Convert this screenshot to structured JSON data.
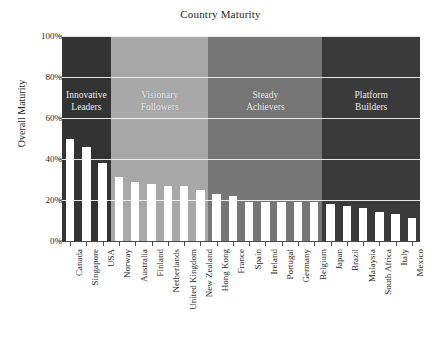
{
  "chart_data": {
    "type": "bar",
    "title": "Country Maturity",
    "xlabel": "",
    "ylabel": "Overall Maturity",
    "ylim": [
      0,
      100
    ],
    "yunit": "%",
    "grid": true,
    "legend": "none",
    "ytick_labels": [
      "0%",
      "20%",
      "40%",
      "60%",
      "80%",
      "100%"
    ],
    "ytick_values": [
      0,
      20,
      40,
      60,
      80,
      100
    ],
    "categories": [
      "Canada",
      "Singapore",
      "USA",
      "Norway",
      "Australia",
      "Finland",
      "Netherlands",
      "United Kingdom",
      "New Zealand",
      "Hong Kong",
      "France",
      "Spain",
      "Ireland",
      "Portugal",
      "Germany",
      "Belgium",
      "Japan",
      "Brazil",
      "Malaysia",
      "South Africa",
      "Italy",
      "Mexico"
    ],
    "values": [
      50,
      46,
      38,
      31,
      29,
      28,
      27,
      27,
      25,
      23,
      22,
      19,
      19,
      19,
      19,
      19,
      18,
      17,
      16,
      14,
      13,
      11
    ],
    "bar_color": "#ffffff",
    "bands": [
      {
        "label": "Innovative\nLeaders",
        "color": "#333333",
        "start_index": 0,
        "end_index": 3
      },
      {
        "label": "Visionary\nFollowers",
        "color": "#a8a8a8",
        "start_index": 3,
        "end_index": 9
      },
      {
        "label": "Steady\nAchievers",
        "color": "#767676",
        "start_index": 9,
        "end_index": 16
      },
      {
        "label": "Platform\nBuilders",
        "color": "#3a3a3a",
        "start_index": 16,
        "end_index": 22
      }
    ]
  }
}
